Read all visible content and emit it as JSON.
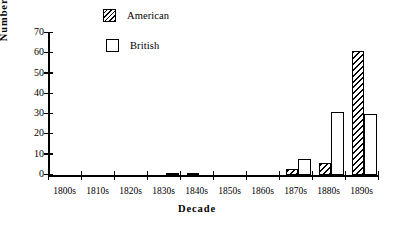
{
  "chart_data": {
    "type": "bar",
    "title": "",
    "subtitle": "",
    "xlabel": "Decade",
    "ylabel": "Number of Papers",
    "categories": [
      "1800s",
      "1810s",
      "1820s",
      "1830s",
      "1840s",
      "1850s",
      "1860s",
      "1870s",
      "1880s",
      "1890s"
    ],
    "series": [
      {
        "name": "American",
        "pattern": "diagonal-hatch",
        "color": "#000000",
        "values": [
          0,
          0,
          0,
          0,
          1,
          0,
          0,
          3,
          6,
          61
        ]
      },
      {
        "name": "British",
        "pattern": "solid-white-outline",
        "color": "#ffffff",
        "values": [
          0,
          0,
          0,
          1,
          0,
          0,
          0,
          8,
          31,
          30
        ]
      }
    ],
    "ylim": [
      0,
      70
    ],
    "yticks": [
      0,
      10,
      20,
      30,
      40,
      50,
      60,
      70
    ],
    "ytick_labels": [
      "0",
      "10",
      "20",
      "30",
      "40",
      "50",
      "60",
      "70"
    ],
    "grid": false,
    "legend_position": "top-center",
    "legend_entries": [
      "American",
      "British"
    ],
    "axis_color": "#000000",
    "background": "#ffffff"
  },
  "legend": {
    "items": [
      {
        "label": "American"
      },
      {
        "label": "British"
      }
    ]
  }
}
